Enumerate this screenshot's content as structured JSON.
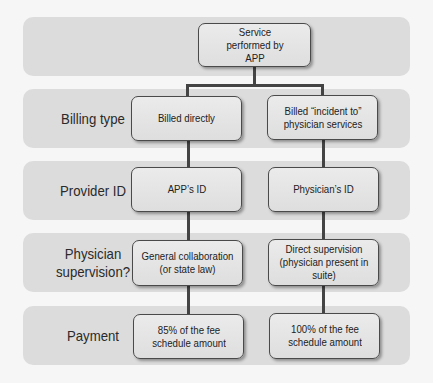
{
  "diagram": {
    "root": "Service performed by APP",
    "rows": [
      {
        "label": "Billing type",
        "left": "Billed directly",
        "right": "Billed “incident to” physician services"
      },
      {
        "label": "Provider ID",
        "left": "APP’s ID",
        "right": "Physician’s ID"
      },
      {
        "label": "Physician supervision?",
        "left": "General collaboration (or state law)",
        "right": "Direct supervision (physician present in suite)"
      },
      {
        "label": "Payment",
        "left": "85% of the fee schedule amount",
        "right": "100% of the fee schedule amount"
      }
    ]
  },
  "colors": {
    "band": "#dcdcdc",
    "box_border": "#4a4a4a",
    "connector": "#444444",
    "background": "#f6f6f6"
  }
}
